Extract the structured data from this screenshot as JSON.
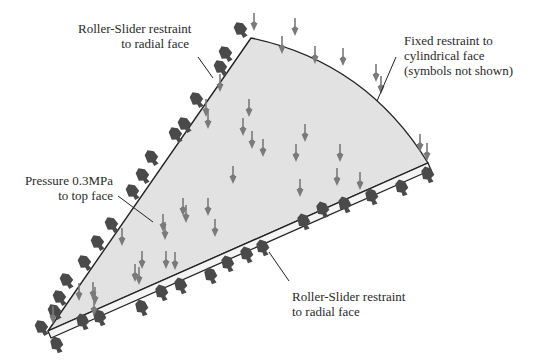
{
  "diagram": {
    "colors": {
      "face_fill": "#e2e2e2",
      "outline": "#222222",
      "pressure_arrow": "#7a7a7a",
      "restraint_symbol": "#4a4a4a",
      "text": "#2a2a2a"
    },
    "geometry": {
      "apex": [
        251,
        38
      ],
      "left_corner": [
        48,
        331
      ],
      "right_corner": [
        428,
        163
      ],
      "slab_offset": [
        3,
        7
      ]
    },
    "labels": {
      "top_left": {
        "line1": "Roller-Slider restraint",
        "line2": "to radial face"
      },
      "top_right": {
        "line1": "Fixed restraint to",
        "line2": "cylindrical face",
        "line3": "(symbols not shown)"
      },
      "middle_left": {
        "line1": "Pressure 0.3MPa",
        "line2": "to top face"
      },
      "bottom_right": {
        "line1": "Roller-Slider restraint",
        "line2": "to radial face"
      }
    },
    "leaders": [
      {
        "name": "top-left-leader",
        "from": [
          198,
          57
        ],
        "to": [
          213,
          78
        ]
      },
      {
        "name": "top-right-leader",
        "from": [
          396,
          57
        ],
        "to": [
          377,
          101
        ]
      },
      {
        "name": "middle-left-leader",
        "from": [
          118,
          196
        ],
        "to": [
          153,
          222
        ]
      },
      {
        "name": "bottom-right-leader",
        "from": [
          269,
          252
        ],
        "to": [
          289,
          281
        ]
      }
    ],
    "pressure_arrows": [
      [
        254,
        27
      ],
      [
        282,
        50
      ],
      [
        295,
        32
      ],
      [
        315,
        60
      ],
      [
        343,
        62
      ],
      [
        376,
        78
      ],
      [
        381,
        90
      ],
      [
        206,
        113
      ],
      [
        249,
        113
      ],
      [
        252,
        145
      ],
      [
        208,
        125
      ],
      [
        243,
        132
      ],
      [
        263,
        153
      ],
      [
        296,
        158
      ],
      [
        233,
        180
      ],
      [
        340,
        158
      ],
      [
        337,
        182
      ],
      [
        300,
        193
      ],
      [
        360,
        186
      ],
      [
        420,
        148
      ],
      [
        427,
        157
      ],
      [
        208,
        212
      ],
      [
        183,
        212
      ],
      [
        163,
        228
      ],
      [
        186,
        219
      ],
      [
        165,
        236
      ],
      [
        215,
        233
      ],
      [
        122,
        242
      ],
      [
        142,
        265
      ],
      [
        166,
        265
      ],
      [
        175,
        266
      ],
      [
        135,
        278
      ],
      [
        139,
        281
      ],
      [
        79,
        297
      ],
      [
        95,
        301
      ],
      [
        94,
        312
      ],
      [
        53,
        320
      ],
      [
        93,
        296
      ],
      [
        305,
        138
      ],
      [
        220,
        88
      ]
    ],
    "restraints_left_edge": [
      [
        241,
        30
      ],
      [
        226,
        54
      ],
      [
        221,
        68
      ],
      [
        197,
        100
      ],
      [
        185,
        125
      ],
      [
        176,
        135
      ],
      [
        152,
        158
      ],
      [
        143,
        176
      ],
      [
        133,
        192
      ],
      [
        112,
        225
      ],
      [
        98,
        243
      ],
      [
        85,
        263
      ],
      [
        67,
        281
      ],
      [
        60,
        298
      ],
      [
        55,
        312
      ],
      [
        42,
        328
      ]
    ],
    "restraints_bottom_edge": [
      [
        57,
        345
      ],
      [
        83,
        322
      ],
      [
        100,
        318
      ],
      [
        142,
        308
      ],
      [
        162,
        293
      ],
      [
        181,
        286
      ],
      [
        211,
        276
      ],
      [
        228,
        264
      ],
      [
        247,
        255
      ],
      [
        263,
        248
      ],
      [
        304,
        222
      ],
      [
        323,
        210
      ],
      [
        345,
        205
      ],
      [
        372,
        197
      ],
      [
        402,
        188
      ],
      [
        428,
        175
      ]
    ]
  }
}
